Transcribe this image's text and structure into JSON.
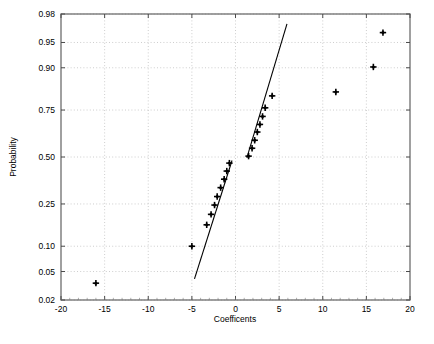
{
  "chart_data": {
    "type": "scatter",
    "title": "",
    "xlabel": "Coefficents",
    "ylabel": "Probability",
    "xlim": [
      -20,
      20
    ],
    "grid": true,
    "legend": false,
    "y_scale": "normal-probability",
    "xticks": [
      -20,
      -15,
      -10,
      -5,
      0,
      5,
      10,
      15,
      20
    ],
    "xtick_labels": [
      "-20",
      "-15",
      "-10",
      "-5",
      "0",
      "5",
      "10",
      "15",
      "20"
    ],
    "yticks": [
      0.02,
      0.05,
      0.1,
      0.25,
      0.5,
      0.75,
      0.9,
      0.95,
      0.98
    ],
    "ytick_labels": [
      "0.02",
      "0.05",
      "0.10",
      "0.25",
      "0.50",
      "0.75",
      "0.90",
      "0.95",
      "0.98"
    ],
    "series": [
      {
        "name": "data-points",
        "marker": "plus",
        "color": "#000000",
        "points": [
          {
            "x": -16.0,
            "y": 0.035
          },
          {
            "x": -5.0,
            "y": 0.1
          },
          {
            "x": -3.3,
            "y": 0.165
          },
          {
            "x": -2.8,
            "y": 0.205
          },
          {
            "x": -2.4,
            "y": 0.245
          },
          {
            "x": -2.1,
            "y": 0.285
          },
          {
            "x": -1.7,
            "y": 0.33
          },
          {
            "x": -1.3,
            "y": 0.375
          },
          {
            "x": -1.0,
            "y": 0.42
          },
          {
            "x": -0.7,
            "y": 0.465
          },
          {
            "x": 1.5,
            "y": 0.505
          },
          {
            "x": 1.9,
            "y": 0.55
          },
          {
            "x": 2.2,
            "y": 0.595
          },
          {
            "x": 2.5,
            "y": 0.64
          },
          {
            "x": 2.8,
            "y": 0.68
          },
          {
            "x": 3.1,
            "y": 0.72
          },
          {
            "x": 3.4,
            "y": 0.76
          },
          {
            "x": 4.2,
            "y": 0.81
          },
          {
            "x": 11.5,
            "y": 0.825
          },
          {
            "x": 15.8,
            "y": 0.902
          },
          {
            "x": 16.9,
            "y": 0.963
          }
        ]
      },
      {
        "name": "reference-line-lower",
        "type": "line",
        "color": "#000000",
        "from": {
          "x": -4.7,
          "y": 0.04
        },
        "to": {
          "x": -0.4,
          "y": 0.48
        }
      },
      {
        "name": "reference-line-upper",
        "type": "line",
        "color": "#000000",
        "from": {
          "x": 1.3,
          "y": 0.495
        },
        "to": {
          "x": 5.9,
          "y": 0.972
        }
      }
    ]
  },
  "caption": {
    "line1": ""
  }
}
